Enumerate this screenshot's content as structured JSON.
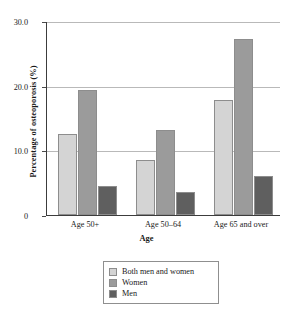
{
  "chart_data": {
    "type": "bar",
    "title": "",
    "xlabel": "Age",
    "ylabel": "Percentage of osteoporosis (%)",
    "categories": [
      "Age 50+",
      "Age 50–64",
      "Age 65 and over"
    ],
    "series": [
      {
        "name": "Both men and women",
        "values": [
          12.5,
          8.5,
          17.8
        ],
        "color": "#d4d4d4"
      },
      {
        "name": "Women",
        "values": [
          19.4,
          13.2,
          27.2
        ],
        "color": "#9b9b9b"
      },
      {
        "name": "Men",
        "values": [
          4.5,
          3.5,
          6.0
        ],
        "color": "#5f5f5f"
      }
    ],
    "ylim": [
      0,
      30
    ],
    "yticks": [
      0,
      10,
      20,
      30
    ],
    "ytick_labels": [
      "0",
      "10.0",
      "20.0",
      "30.0"
    ],
    "grid": true,
    "legend_position": "below-axes"
  },
  "axes": {
    "y_title": "Percentage of osteoporosis (%)",
    "x_title": "Age"
  },
  "legend": {
    "items": [
      {
        "label": "Both men and women"
      },
      {
        "label": "Women"
      },
      {
        "label": "Men"
      }
    ]
  }
}
